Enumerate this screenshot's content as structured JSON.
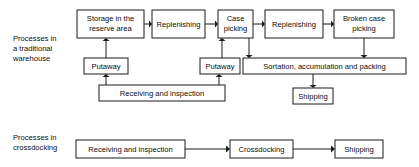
{
  "figure": {
    "background_color": "#ffffff",
    "line_color": "#1a1a1a",
    "text_color": "#0d0d0d"
  },
  "groups": [
    {
      "id": "traditional",
      "label_lines": [
        "Processes in",
        "a traditional",
        "warehouse"
      ],
      "label_line_1": "Processes in",
      "label_line_2": "a traditional",
      "label_line_3": "warehouse"
    },
    {
      "id": "crossdocking",
      "label_lines": [
        "Processes in",
        "crossdocking"
      ],
      "label_line_1": "Processes in",
      "label_line_2": "crossdocking"
    }
  ],
  "nodes": {
    "storage_reserve": {
      "label": "Storage in the reserve area",
      "label_line_1": "Storage in the",
      "label_line_2": "reserve area",
      "x": 77,
      "y": 10,
      "w": 67,
      "h": 28
    },
    "replenishing_1": {
      "label": "Replenishing",
      "label_line_1": "Replenishing",
      "x": 152,
      "y": 10,
      "w": 53,
      "h": 28
    },
    "case_picking": {
      "label": "Case picking",
      "label_line_1": "Case",
      "label_line_2": "picking",
      "x": 218,
      "y": 10,
      "w": 35,
      "h": 28
    },
    "replenishing_2": {
      "label": "Replenishing",
      "label_line_1": "Replenishing",
      "x": 265,
      "y": 10,
      "w": 58,
      "h": 28
    },
    "broken_case_picking": {
      "label": "Broken case picking",
      "label_line_1": "Broken case",
      "label_line_2": "picking",
      "x": 334,
      "y": 10,
      "w": 60,
      "h": 28
    },
    "putaway_1": {
      "label": "Putaway",
      "label_line_1": "Putaway",
      "x": 84,
      "y": 58,
      "w": 44,
      "h": 16
    },
    "putaway_2": {
      "label": "Putaway",
      "label_line_1": "Putaway",
      "x": 200,
      "y": 58,
      "w": 40,
      "h": 16
    },
    "sortation": {
      "label": "Sortation, accumulation and packing",
      "label_line_1": "Sortation, accumulation and packing",
      "x": 243,
      "y": 58,
      "w": 163,
      "h": 16
    },
    "receiving_top": {
      "label": "Receiving and inspection",
      "label_line_1": "Receiving and inspection",
      "x": 99,
      "y": 85,
      "w": 126,
      "h": 16
    },
    "shipping_top": {
      "label": "Shipping",
      "label_line_1": "Shipping",
      "x": 293,
      "y": 88,
      "w": 40,
      "h": 16
    },
    "receiving_bottom": {
      "label": "Receiving and inspection",
      "label_line_1": "Receiving and inspection",
      "x": 76,
      "y": 140,
      "w": 109,
      "h": 18
    },
    "crossdocking": {
      "label": "Crossdocking",
      "label_line_1": "Crossdocking",
      "x": 230,
      "y": 140,
      "w": 63,
      "h": 18
    },
    "shipping_bottom": {
      "label": "Shipping",
      "label_line_1": "Shipping",
      "x": 335,
      "y": 140,
      "w": 48,
      "h": 18
    }
  },
  "edges": [
    {
      "from": "storage_reserve",
      "to": "replenishing_1",
      "direction": "right"
    },
    {
      "from": "replenishing_1",
      "to": "case_picking",
      "direction": "right"
    },
    {
      "from": "case_picking",
      "to": "replenishing_2",
      "direction": "right"
    },
    {
      "from": "replenishing_2",
      "to": "broken_case_picking",
      "direction": "right"
    },
    {
      "from": "putaway_1",
      "to": "storage_reserve",
      "direction": "up"
    },
    {
      "from": "receiving_top",
      "to": "putaway_1",
      "direction": "up"
    },
    {
      "from": "receiving_top",
      "to": "putaway_2",
      "direction": "up"
    },
    {
      "from": "putaway_2",
      "to": "case_picking",
      "direction": "up"
    },
    {
      "from": "case_picking",
      "to": "sortation",
      "direction": "down"
    },
    {
      "from": "broken_case_picking",
      "to": "sortation",
      "direction": "down"
    },
    {
      "from": "sortation",
      "to": "shipping_top",
      "direction": "down"
    },
    {
      "from": "receiving_bottom",
      "to": "crossdocking",
      "direction": "right"
    },
    {
      "from": "crossdocking",
      "to": "shipping_bottom",
      "direction": "right"
    }
  ]
}
